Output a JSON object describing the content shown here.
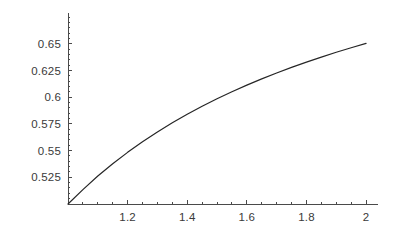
{
  "chart_data": {
    "type": "line",
    "title": "",
    "subtitle": "",
    "xlabel": "",
    "ylabel": "",
    "xlim": [
      1.0,
      2.03
    ],
    "ylim": [
      0.5,
      0.679
    ],
    "grid": false,
    "legend": null,
    "x_ticks": [
      {
        "value": 1.2,
        "label": "1.2"
      },
      {
        "value": 1.4,
        "label": "1.4"
      },
      {
        "value": 1.6,
        "label": "1.6"
      },
      {
        "value": 1.8,
        "label": "1.8"
      },
      {
        "value": 2.0,
        "label": "2"
      }
    ],
    "y_ticks": [
      {
        "value": 0.525,
        "label": "0.525"
      },
      {
        "value": 0.55,
        "label": "0.55"
      },
      {
        "value": 0.575,
        "label": "0.575"
      },
      {
        "value": 0.6,
        "label": "0.6"
      },
      {
        "value": 0.625,
        "label": "0.625"
      },
      {
        "value": 0.65,
        "label": "0.65"
      }
    ],
    "x_minor_tick_step": 0.05,
    "y_minor_tick_step": 0.005,
    "series": [
      {
        "name": "curve",
        "color": "#262626",
        "line_width": 1.2,
        "x": [
          1.0,
          1.05,
          1.1,
          1.15,
          1.2,
          1.25,
          1.3,
          1.35,
          1.4,
          1.45,
          1.5,
          1.55,
          1.6,
          1.65,
          1.7,
          1.75,
          1.8,
          1.85,
          1.9,
          1.95,
          2.0
        ],
        "values": [
          0.5,
          0.5135,
          0.5262,
          0.5377,
          0.5484,
          0.5583,
          0.5675,
          0.5761,
          0.5841,
          0.5916,
          0.5986,
          0.6052,
          0.6114,
          0.6173,
          0.6228,
          0.628,
          0.633,
          0.6377,
          0.6422,
          0.6464,
          0.6505
        ]
      }
    ]
  },
  "axes": {
    "axis_color": "#4a4a4a",
    "tick_color": "#4a4a4a",
    "background": "#ffffff",
    "origin_value_x": 1.0,
    "origin_value_y": 0.5
  }
}
